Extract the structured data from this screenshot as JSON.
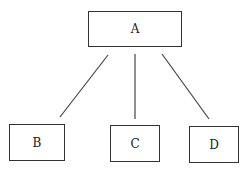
{
  "diagram": {
    "type": "tree",
    "nodes": [
      {
        "id": "A",
        "label": "A"
      },
      {
        "id": "B",
        "label": "B"
      },
      {
        "id": "C",
        "label": "C"
      },
      {
        "id": "D",
        "label": "D"
      }
    ],
    "edges": [
      {
        "from": "A",
        "to": "B"
      },
      {
        "from": "A",
        "to": "C"
      },
      {
        "from": "A",
        "to": "D"
      }
    ]
  }
}
